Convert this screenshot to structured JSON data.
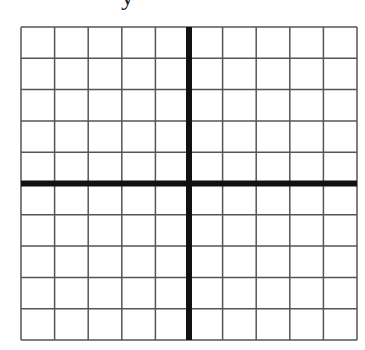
{
  "diagram": {
    "type": "coordinate-grid",
    "axis_label_top": "y",
    "columns": 10,
    "rows": 10,
    "grid": {
      "left": 21,
      "top": 27,
      "right": 357,
      "bottom": 340
    },
    "colors": {
      "grid_line": "#555555",
      "axis_line": "#111111",
      "background": "#ffffff"
    }
  }
}
